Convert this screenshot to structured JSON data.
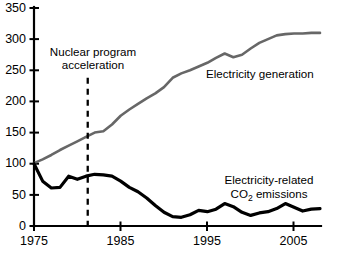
{
  "chart_data": {
    "type": "line",
    "title": "",
    "xlabel": "",
    "ylabel": "",
    "xlim": [
      1975,
      2008
    ],
    "ylim": [
      0,
      350
    ],
    "grid": false,
    "legend_position": "inline-labels",
    "x_ticks": [
      "1975",
      "1985",
      "1995",
      "2005"
    ],
    "x_tick_values": [
      1975,
      1985,
      1995,
      2005
    ],
    "y_ticks": [
      "0",
      "50",
      "100",
      "150",
      "200",
      "250",
      "300",
      "350"
    ],
    "y_tick_values": [
      0,
      50,
      100,
      150,
      200,
      250,
      300,
      350
    ],
    "x": [
      1975,
      1976,
      1977,
      1978,
      1979,
      1980,
      1981,
      1982,
      1983,
      1984,
      1985,
      1986,
      1987,
      1988,
      1989,
      1990,
      1991,
      1992,
      1993,
      1994,
      1995,
      1996,
      1997,
      1998,
      1999,
      2000,
      2001,
      2002,
      2003,
      2004,
      2005,
      2006,
      2007,
      2008
    ],
    "series": [
      {
        "name": "Electricity generation",
        "color": "#676767",
        "label_text": "Electricity generation",
        "values": [
          101,
          107,
          114,
          122,
          129,
          136,
          143,
          150,
          152,
          163,
          177,
          187,
          196,
          205,
          213,
          223,
          238,
          245,
          250,
          256,
          262,
          270,
          277,
          271,
          275,
          285,
          294,
          300,
          306,
          308,
          309,
          309,
          310,
          310
        ]
      },
      {
        "name": "Electricity-related CO2 emissions",
        "color": "#000000",
        "label_line1": "Electricity-related",
        "label_line2_pre": "CO",
        "label_line2_sub": "2",
        "label_line2_post": " emissions",
        "values": [
          100,
          72,
          61,
          62,
          80,
          75,
          80,
          83,
          82,
          80,
          72,
          62,
          55,
          45,
          33,
          22,
          15,
          14,
          18,
          25,
          23,
          27,
          36,
          31,
          22,
          17,
          21,
          23,
          28,
          36,
          30,
          24,
          27,
          28
        ]
      }
    ],
    "annotations": [
      {
        "name": "nuclear-program-acceleration",
        "line1": "Nuclear program",
        "line2": "acceleration",
        "marker_type": "vertical-dashed-line",
        "x_value": 1981.2,
        "y_from": 0,
        "y_to": 238
      }
    ],
    "caption_partial": ""
  }
}
